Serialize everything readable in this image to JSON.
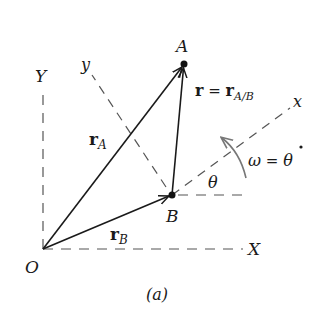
{
  "diagram": {
    "caption": "(a)",
    "points": {
      "A": {
        "label": "A",
        "x": 184,
        "y": 64
      },
      "B": {
        "label": "B",
        "x": 172,
        "y": 195
      },
      "O": {
        "label": "O",
        "x": 43,
        "y": 249
      }
    },
    "axes": {
      "X": "X",
      "Y": "Y",
      "x": "x",
      "y": "y"
    },
    "vectors": {
      "rA": {
        "base": "r",
        "sub": "A"
      },
      "rB": {
        "base": "r",
        "sub": "B"
      },
      "r": {
        "lhs": "r",
        "eq": " = ",
        "base": "r",
        "sub": "A/B"
      }
    },
    "angle": {
      "theta": "θ",
      "omega_lhs": "ω",
      "omega_eq": " = ",
      "omega_rhs": "θ"
    },
    "colors": {
      "line": "#1a1a1a",
      "dash": "#555555",
      "arc": "#777777"
    }
  }
}
